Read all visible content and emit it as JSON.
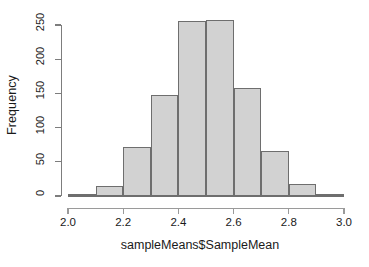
{
  "chart_data": {
    "type": "bar",
    "subtype": "histogram",
    "title": "",
    "xlabel": "sampleMeans$SampleMean",
    "ylabel": "Frequency",
    "xlim": [
      2.0,
      3.0
    ],
    "ylim": [
      0,
      258
    ],
    "grid": false,
    "legend": null,
    "bin_width": 0.1,
    "bin_edges": [
      2.0,
      2.1,
      2.2,
      2.3,
      2.4,
      2.5,
      2.6,
      2.7,
      2.8,
      2.9,
      3.0
    ],
    "categories": [
      "2.0-2.1",
      "2.1-2.2",
      "2.2-2.3",
      "2.3-2.4",
      "2.4-2.5",
      "2.5-2.6",
      "2.6-2.7",
      "2.7-2.8",
      "2.8-2.9",
      "2.9-3.0"
    ],
    "values": [
      1,
      15,
      71,
      147,
      256,
      258,
      158,
      66,
      17,
      1
    ],
    "xticks": [
      2.0,
      2.2,
      2.4,
      2.6,
      2.8,
      3.0
    ],
    "xtick_labels": [
      "2.0",
      "2.2",
      "2.4",
      "2.6",
      "2.8",
      "3.0"
    ],
    "yticks": [
      0,
      50,
      100,
      150,
      200,
      250
    ],
    "ytick_labels": [
      "0",
      "50",
      "100",
      "150",
      "200",
      "250"
    ],
    "bar_fill_color": "#d2d2d2",
    "bar_border_color": "#6e6e6e",
    "axis_color": "#7d7d7d",
    "background_color": "#ffffff"
  }
}
